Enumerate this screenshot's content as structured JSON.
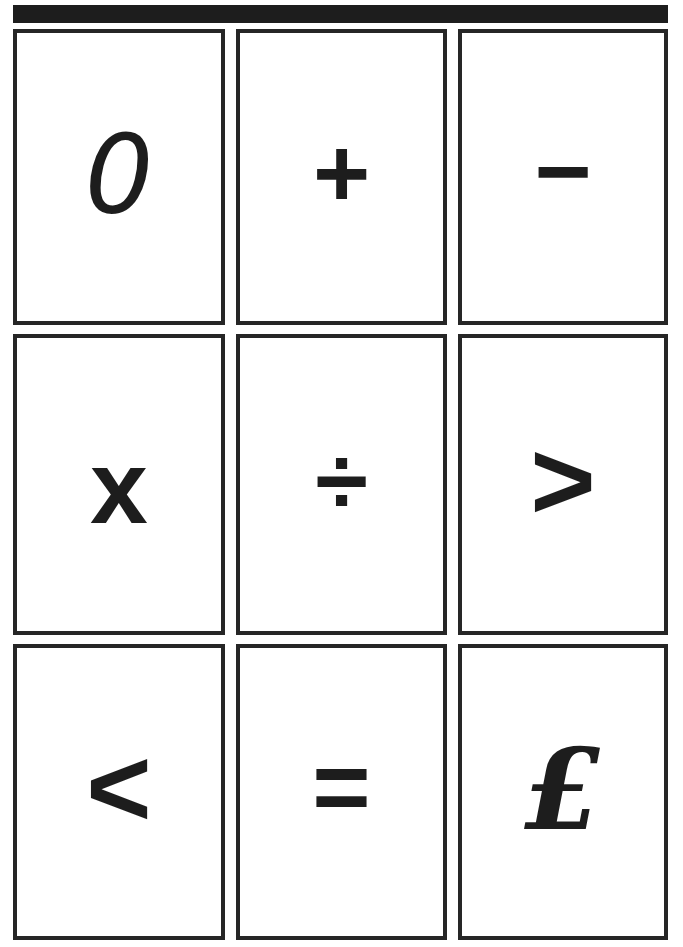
{
  "page": {
    "background_color": "#ffffff",
    "ink_color": "#1d1d1d",
    "border_color": "#262626"
  },
  "header": {
    "name": "top-black-bar",
    "label": "",
    "color": "#1d1d1d"
  },
  "grid": {
    "rows": 3,
    "columns": 3,
    "cards": [
      {
        "id": "zero",
        "symbol": "0",
        "icon": "digit-zero-icon"
      },
      {
        "id": "plus",
        "symbol": "+",
        "icon": "plus-icon"
      },
      {
        "id": "minus",
        "symbol": "−",
        "icon": "minus-icon"
      },
      {
        "id": "times",
        "symbol": "x",
        "icon": "multiply-icon"
      },
      {
        "id": "divide",
        "symbol": "÷",
        "icon": "divide-icon"
      },
      {
        "id": "gt",
        "symbol": ">",
        "icon": "greater-than-icon"
      },
      {
        "id": "lt",
        "symbol": "<",
        "icon": "less-than-icon"
      },
      {
        "id": "equals",
        "symbol": "=",
        "icon": "equals-icon"
      },
      {
        "id": "pound",
        "symbol": "£",
        "icon": "pound-sterling-icon"
      }
    ]
  }
}
